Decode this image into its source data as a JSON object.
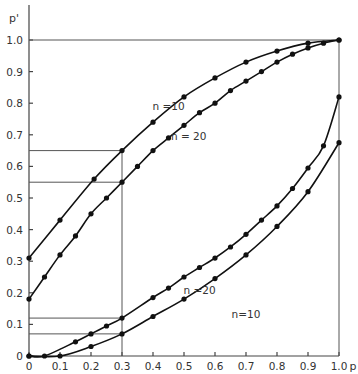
{
  "chart_data": {
    "type": "line",
    "title": "",
    "xlabel": "p",
    "ylabel": "p'",
    "xlim": [
      0,
      1.0
    ],
    "ylim": [
      0,
      1.0
    ],
    "grid": false,
    "x_ticks": [
      "0",
      "0.1",
      "0.2",
      "0.3",
      "0.4",
      "0.5",
      "0.6",
      "0.7",
      "0.8",
      "0.9",
      "1.0"
    ],
    "y_ticks": [
      "0",
      "0.1",
      "0.2",
      "0.3",
      "0.4",
      "0.5",
      "0.6",
      "0.7",
      "0.8",
      "0.9",
      "1.0"
    ],
    "series": [
      {
        "name": "n = 10 (upper)",
        "label": "n =10",
        "x": [
          0,
          0.1,
          0.21,
          0.3,
          0.4,
          0.5,
          0.6,
          0.7,
          0.8,
          0.9,
          1.0
        ],
        "y": [
          0.31,
          0.43,
          0.56,
          0.65,
          0.74,
          0.82,
          0.88,
          0.93,
          0.965,
          0.99,
          1.0
        ]
      },
      {
        "name": "n = 20 (upper)",
        "label": "n = 20",
        "x": [
          0,
          0.05,
          0.1,
          0.15,
          0.2,
          0.25,
          0.3,
          0.35,
          0.4,
          0.45,
          0.5,
          0.55,
          0.6,
          0.65,
          0.7,
          0.75,
          0.8,
          0.85,
          0.9,
          0.95,
          1.0
        ],
        "y": [
          0.18,
          0.25,
          0.32,
          0.38,
          0.45,
          0.5,
          0.55,
          0.6,
          0.65,
          0.69,
          0.73,
          0.77,
          0.8,
          0.84,
          0.87,
          0.9,
          0.93,
          0.955,
          0.975,
          0.99,
          1.0
        ]
      },
      {
        "name": "n = 20 (lower)",
        "label": "n =20",
        "x": [
          0,
          0.05,
          0.15,
          0.2,
          0.25,
          0.3,
          0.4,
          0.45,
          0.5,
          0.55,
          0.6,
          0.65,
          0.7,
          0.75,
          0.8,
          0.85,
          0.9,
          0.95,
          1.0
        ],
        "y": [
          0,
          0,
          0.045,
          0.07,
          0.095,
          0.12,
          0.185,
          0.215,
          0.25,
          0.28,
          0.31,
          0.345,
          0.385,
          0.43,
          0.475,
          0.53,
          0.595,
          0.665,
          0.82
        ]
      },
      {
        "name": "n = 10 (lower)",
        "label": "n=10",
        "x": [
          0,
          0.1,
          0.2,
          0.3,
          0.4,
          0.5,
          0.6,
          0.7,
          0.8,
          0.9,
          1.0
        ],
        "y": [
          0,
          0,
          0.03,
          0.07,
          0.125,
          0.18,
          0.245,
          0.32,
          0.41,
          0.52,
          0.675
        ]
      }
    ],
    "reference_lines": {
      "p": 0.3,
      "horizontal_levels": [
        0.65,
        0.55,
        0.12,
        0.07
      ],
      "top_level": 1.0,
      "right_edge": 1.0
    },
    "curve_labels": [
      {
        "text": "n =10",
        "x": 0.45,
        "y": 0.78
      },
      {
        "text": "n = 20",
        "x": 0.515,
        "y": 0.685
      },
      {
        "text": "n =20",
        "x": 0.55,
        "y": 0.195
      },
      {
        "text": "n=10",
        "x": 0.7,
        "y": 0.12
      }
    ]
  }
}
